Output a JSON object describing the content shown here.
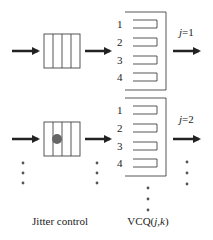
{
  "diagram": {
    "colors": {
      "line": "#333333",
      "arrow": "#222222",
      "dot": "#555555",
      "text": "#222222"
    },
    "rows": [
      {
        "id": "row-1",
        "jitter_has_packet": false,
        "queue_labels": [
          "1",
          "2",
          "3",
          "4"
        ],
        "output_label": "j=1",
        "output_label_j": "j",
        "output_label_rest": "=1"
      },
      {
        "id": "row-2",
        "jitter_has_packet": true,
        "queue_labels": [
          "1",
          "2",
          "3",
          "4"
        ],
        "output_label": "j=2",
        "output_label_j": "j",
        "output_label_rest": "=2"
      }
    ],
    "captions": {
      "jitter": "Jitter control",
      "vcq_prefix": "VCQ(",
      "vcq_j": "j",
      "vcq_sep": ",",
      "vcq_k": "k",
      "vcq_suffix": ")"
    }
  }
}
